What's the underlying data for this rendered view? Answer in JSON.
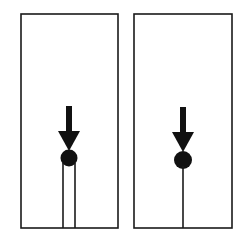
{
  "figure": {
    "background_color": "#ffffff",
    "stroke_color": "#1a1a1a",
    "fill_color": "#111111",
    "width": 250,
    "height": 245,
    "panel_count": 2
  },
  "panels": [
    {
      "id": "left-panel",
      "label": "left",
      "frame": {
        "x": 21,
        "y": 14,
        "width": 97,
        "height": 214,
        "stroke_width": 1.6
      },
      "arrow": {
        "name": "downward-force-arrow",
        "shaft_x": 69,
        "shaft_top_y": 106,
        "shaft_width": 6,
        "head_top_y": 131,
        "head_half_width": 11,
        "tip_y": 151,
        "color": "#111111"
      },
      "ball": {
        "name": "mass-ball",
        "cx": 69,
        "cy": 158,
        "r": 8.5,
        "color": "#111111"
      },
      "support": {
        "name": "double-line-support",
        "type": "two-parallel-lines",
        "line_count": 2,
        "x_positions": [
          63,
          75
        ],
        "top_y": 163,
        "bottom_y": 228,
        "stroke_width": 1.6,
        "color": "#1a1a1a"
      }
    },
    {
      "id": "right-panel",
      "label": "right",
      "frame": {
        "x": 134,
        "y": 14,
        "width": 98,
        "height": 214,
        "stroke_width": 1.6
      },
      "arrow": {
        "name": "downward-force-arrow",
        "shaft_x": 183,
        "shaft_top_y": 107,
        "shaft_width": 6,
        "head_top_y": 132,
        "head_half_width": 11,
        "tip_y": 152,
        "color": "#111111"
      },
      "ball": {
        "name": "mass-ball",
        "cx": 183,
        "cy": 160,
        "r": 9,
        "color": "#111111"
      },
      "support": {
        "name": "single-line-support",
        "type": "single-line",
        "line_count": 1,
        "x_positions": [
          183
        ],
        "top_y": 166,
        "bottom_y": 228,
        "stroke_width": 1.6,
        "color": "#1a1a1a"
      }
    }
  ],
  "labels": {
    "panel_left_text": "",
    "panel_right_text": "",
    "caption": ""
  }
}
